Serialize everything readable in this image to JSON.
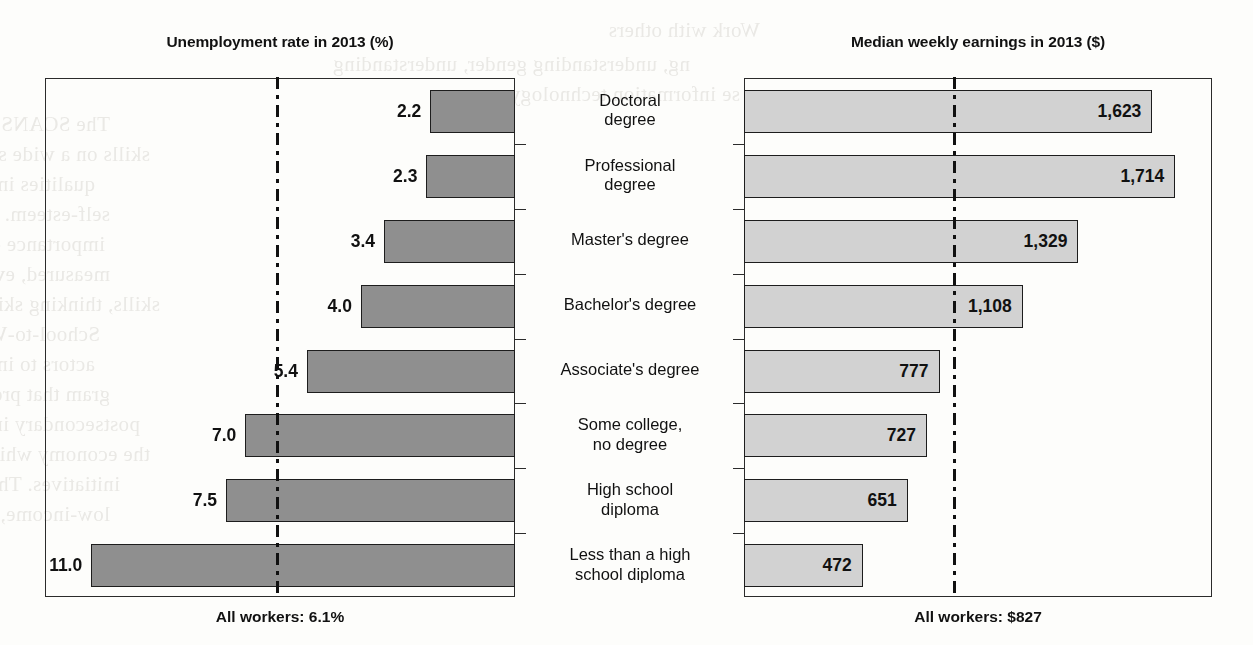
{
  "chart_data": {
    "type": "bar",
    "orientation": "horizontal-diverging",
    "categories": [
      "Doctoral degree",
      "Professional degree",
      "Master's degree",
      "Bachelor's degree",
      "Associate's degree",
      "Some college, no degree",
      "High school diploma",
      "Less than a high school diploma"
    ],
    "category_lines": [
      [
        "Doctoral",
        "degree"
      ],
      [
        "Professional",
        "degree"
      ],
      [
        "Master's degree"
      ],
      [
        "Bachelor's degree"
      ],
      [
        "Associate's degree"
      ],
      [
        "Some college,",
        "no degree"
      ],
      [
        "High school",
        "diploma"
      ],
      [
        "Less than a high",
        "school diploma"
      ]
    ],
    "series": [
      {
        "name": "Unemployment rate in 2013 (%)",
        "side": "left",
        "unit": "%",
        "values": [
          2.2,
          2.3,
          3.4,
          4.0,
          5.4,
          7.0,
          7.5,
          11.0
        ],
        "labels": [
          "2.2",
          "2.3",
          "3.4",
          "4.0",
          "5.4",
          "7.0",
          "7.5",
          "11.0"
        ],
        "axis_max": 12.2,
        "reference_value": 6.1,
        "reference_label": "All workers: 6.1%",
        "bar_color": "#8f8f8f",
        "bar_border": "#1d1d1d"
      },
      {
        "name": "Median weekly earnings in 2013 ($)",
        "side": "right",
        "unit": "$",
        "values": [
          1623,
          1714,
          1329,
          1108,
          777,
          727,
          651,
          472
        ],
        "labels": [
          "1,623",
          "1,714",
          "1,329",
          "1,108",
          "777",
          "727",
          "651",
          "472"
        ],
        "axis_max": 1860,
        "reference_value": 827,
        "reference_label": "All workers: $827",
        "bar_color": "#d2d2d2",
        "bar_border": "#1d1d1d"
      }
    ],
    "title_left": "Unemployment rate in 2013 (%)",
    "title_right": "Median weekly earnings in 2013 ($)",
    "footer_left": "All workers: 6.1%",
    "footer_right": "All workers: $827",
    "grid": false,
    "legend": "none",
    "reference_line_style": "dash-dot"
  },
  "ghost_text": [
    {
      "t": "Work with others",
      "x": 760,
      "y": 18
    },
    {
      "t": "ng, understanding gender, understanding",
      "x": 690,
      "y": 52
    },
    {
      "t": "se information technology.",
      "x": 740,
      "y": 82
    },
    {
      "t": "The SCANS report encouraged schools to teach these foundational",
      "x": 110,
      "y": 112
    },
    {
      "t": "skills on a wide scale, as well as personal qualities. Personal",
      "x": 150,
      "y": 142
    },
    {
      "t": "qualities included responsibility, sociability, self-management, integrity, and",
      "x": 95,
      "y": 172
    },
    {
      "t": "self-esteem. The SCANS report also drew unprecedented attention to the",
      "x": 110,
      "y": 202
    },
    {
      "t": "importance of employability skills, and for the first time, these skills were",
      "x": 105,
      "y": 232
    },
    {
      "t": "measured, evaluated, and reported on a par with academic skills, thinking",
      "x": 110,
      "y": 262
    },
    {
      "t": "skills, thinking skills, and personal qualities.",
      "x": 160,
      "y": 292
    },
    {
      "t": "School-to-Work opportunities encouraged educators and administrators",
      "x": 100,
      "y": 322
    },
    {
      "t": "actors to integrate academic and technical knowledge and skill. A charter pro-",
      "x": 95,
      "y": 352
    },
    {
      "t": "gram that prepares high schools for careers and careers in the world of",
      "x": 110,
      "y": 382
    },
    {
      "t": "postsecondary institutions (Hamilton, 1993). School-to-Work",
      "x": 140,
      "y": 412
    },
    {
      "t": "the economy while career awareness and exploration were",
      "x": 150,
      "y": 442
    },
    {
      "t": "initiatives. The School-to-Work Act of 1994 also provided for",
      "x": 120,
      "y": 472
    },
    {
      "t": "low-income, at-risk students who would benefit from career and",
      "x": 110,
      "y": 502
    }
  ]
}
